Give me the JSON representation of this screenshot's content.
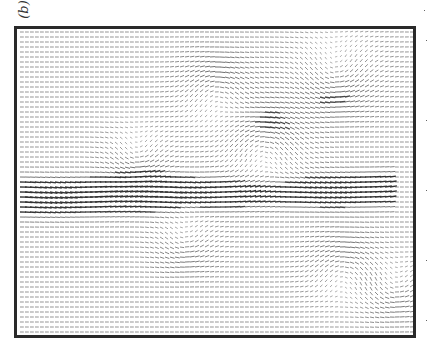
{
  "figure": {
    "panel_label": "(b)",
    "type": "vector field (PIV velocity map)",
    "frame_color": "#2a2a2a",
    "arrow_color": "#333333"
  },
  "chart_data": {
    "type": "quiver",
    "title": "",
    "xlabel": "",
    "ylabel": "",
    "grid": false,
    "frame": {
      "x": 14,
      "y": 26,
      "width": 402,
      "height": 312
    },
    "spacing": 5,
    "base_flow": {
      "u": 1.0,
      "v": 0.0
    },
    "jet": {
      "y_start": 0.55,
      "y_end": 0.52,
      "x_end": 0.95,
      "width": 0.06,
      "strength": 2.2
    },
    "vortices": [
      {
        "x": 0.62,
        "y": 0.38,
        "gamma": 1.6,
        "r": 0.08
      },
      {
        "x": 0.3,
        "y": 0.42,
        "gamma": -1.2,
        "r": 0.06
      },
      {
        "x": 0.5,
        "y": 0.2,
        "gamma": 1.3,
        "r": 0.07
      },
      {
        "x": 0.8,
        "y": 0.15,
        "gamma": -1.4,
        "r": 0.08
      },
      {
        "x": 0.82,
        "y": 0.78,
        "gamma": 1.2,
        "r": 0.07
      },
      {
        "x": 0.42,
        "y": 0.7,
        "gamma": -1.0,
        "r": 0.06
      },
      {
        "x": 0.95,
        "y": 0.85,
        "gamma": -1.0,
        "r": 0.06
      }
    ]
  }
}
